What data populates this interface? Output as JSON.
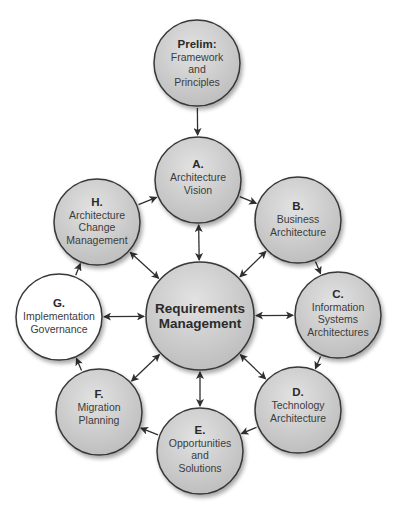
{
  "diagram": {
    "type": "cycle",
    "colors": {
      "node_fill": "#c6c6c6",
      "node_fill_light": "#e2e2e2",
      "node_white": "#ffffff",
      "stroke": "#383838",
      "arrow": "#2f2f2f",
      "text": "#3c3c3c"
    },
    "nodes": [
      {
        "id": "prelim",
        "lead": "Prelim:",
        "lines": [
          "Framework",
          "and",
          "Principles"
        ],
        "cx": 197,
        "cy": 63,
        "r": 43,
        "fill": "gray"
      },
      {
        "id": "a",
        "lead": "A.",
        "lines": [
          "Architecture",
          "Vision"
        ],
        "cx": 198,
        "cy": 180,
        "r": 43,
        "fill": "gray"
      },
      {
        "id": "b",
        "lead": "B.",
        "lines": [
          "Business",
          "Architecture"
        ],
        "cx": 298,
        "cy": 220,
        "r": 43,
        "fill": "gray"
      },
      {
        "id": "c",
        "lead": "C.",
        "lines": [
          "Information",
          "Systems",
          "Architectures"
        ],
        "cx": 338,
        "cy": 315,
        "r": 43,
        "fill": "gray"
      },
      {
        "id": "d",
        "lead": "D.",
        "lines": [
          "Technology",
          "Architecture"
        ],
        "cx": 298,
        "cy": 410,
        "r": 43,
        "fill": "gray"
      },
      {
        "id": "e",
        "lead": "E.",
        "lines": [
          "Opportunities",
          "and",
          "Solutions"
        ],
        "cx": 200,
        "cy": 451,
        "r": 43,
        "fill": "gray"
      },
      {
        "id": "f",
        "lead": "F.",
        "lines": [
          "Migration",
          "Planning"
        ],
        "cx": 99,
        "cy": 412,
        "r": 43,
        "fill": "gray"
      },
      {
        "id": "g",
        "lead": "G.",
        "lines": [
          "Implementation",
          "Governance"
        ],
        "cx": 59,
        "cy": 317,
        "r": 43,
        "fill": "white"
      },
      {
        "id": "h",
        "lead": "H.",
        "lines": [
          "Architecture",
          "Change",
          "Management"
        ],
        "cx": 97,
        "cy": 222,
        "r": 43,
        "fill": "gray"
      }
    ],
    "center": {
      "id": "rm",
      "lines": [
        "Requirements",
        "Management"
      ],
      "cx": 200,
      "cy": 316,
      "r": 54
    },
    "edges": [
      {
        "from": "prelim",
        "to": "a",
        "type": "one-way"
      },
      {
        "from": "a",
        "to": "b",
        "type": "one-way"
      },
      {
        "from": "b",
        "to": "c",
        "type": "one-way"
      },
      {
        "from": "c",
        "to": "d",
        "type": "one-way"
      },
      {
        "from": "d",
        "to": "e",
        "type": "one-way"
      },
      {
        "from": "e",
        "to": "f",
        "type": "one-way"
      },
      {
        "from": "f",
        "to": "g",
        "type": "one-way"
      },
      {
        "from": "g",
        "to": "h",
        "type": "one-way"
      },
      {
        "from": "h",
        "to": "a",
        "type": "one-way"
      },
      {
        "from": "rm",
        "to": "a",
        "type": "two-way"
      },
      {
        "from": "rm",
        "to": "b",
        "type": "two-way"
      },
      {
        "from": "rm",
        "to": "c",
        "type": "two-way"
      },
      {
        "from": "rm",
        "to": "d",
        "type": "two-way"
      },
      {
        "from": "rm",
        "to": "e",
        "type": "two-way"
      },
      {
        "from": "rm",
        "to": "f",
        "type": "two-way"
      },
      {
        "from": "rm",
        "to": "g",
        "type": "two-way"
      },
      {
        "from": "rm",
        "to": "h",
        "type": "two-way"
      }
    ]
  },
  "labels": {
    "prelim": {
      "lead": "Prelim:",
      "l1": "Framework",
      "l2": "and",
      "l3": "Principles"
    },
    "a": {
      "lead": "A.",
      "l1": "Architecture",
      "l2": "Vision"
    },
    "b": {
      "lead": "B.",
      "l1": "Business",
      "l2": "Architecture"
    },
    "c": {
      "lead": "C.",
      "l1": "Information",
      "l2": "Systems",
      "l3": "Architectures"
    },
    "d": {
      "lead": "D.",
      "l1": "Technology",
      "l2": "Architecture"
    },
    "e": {
      "lead": "E.",
      "l1": "Opportunities",
      "l2": "and",
      "l3": "Solutions"
    },
    "f": {
      "lead": "F.",
      "l1": "Migration",
      "l2": "Planning"
    },
    "g": {
      "lead": "G.",
      "l1": "Implementation",
      "l2": "Governance"
    },
    "h": {
      "lead": "H.",
      "l1": "Architecture",
      "l2": "Change",
      "l3": "Management"
    },
    "rm": {
      "l1": "Requirements",
      "l2": "Management"
    }
  }
}
